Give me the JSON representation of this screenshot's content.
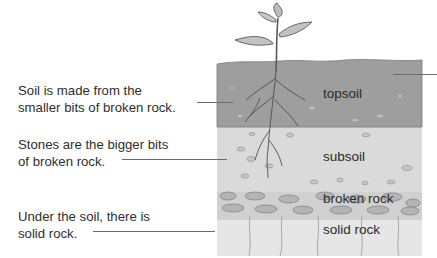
{
  "captions": [
    {
      "line1": "Soil is made from the",
      "line2": "smaller bits of broken rock."
    },
    {
      "line1": "Stones are the bigger bits",
      "line2": "of broken rock."
    },
    {
      "line1": "Under the soil, there is",
      "line2": "solid rock."
    }
  ],
  "layers": [
    {
      "name": "topsoil",
      "color": "#9c9c9c"
    },
    {
      "name": "subsoil",
      "color": "#d6d6d6"
    },
    {
      "name": "broken rock",
      "color": "#c4c4c4"
    },
    {
      "name": "solid rock",
      "color": "#e4e4e4"
    }
  ],
  "illustration": {
    "subject": "plant-with-roots",
    "icon": "seedling-icon"
  }
}
